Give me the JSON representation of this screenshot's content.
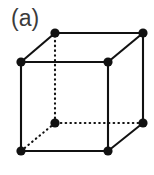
{
  "figure": {
    "panel_label": "(a)",
    "caption_visible": false,
    "background_color": "#ffffff",
    "ink_color": "#111111",
    "label_color": "#3b3b3b",
    "width": 154,
    "height": 175
  },
  "diagram": {
    "name": "simple-cubic-unit-cell",
    "vertex_radius": 4.6,
    "vertex_fill": "#111111",
    "solid_stroke_width": 2.1,
    "dotted_stroke_width": 2.1,
    "dotted_dash_pattern": "0.6 4.2",
    "vertices": [
      {
        "id": "front-top-left",
        "x": 21,
        "y": 62,
        "hidden": false
      },
      {
        "id": "front-top-right",
        "x": 108,
        "y": 62,
        "hidden": false
      },
      {
        "id": "front-bottom-right",
        "x": 108,
        "y": 151,
        "hidden": false
      },
      {
        "id": "front-bottom-left",
        "x": 21,
        "y": 151,
        "hidden": false
      },
      {
        "id": "back-top-left",
        "x": 55,
        "y": 33,
        "hidden": false
      },
      {
        "id": "back-top-right",
        "x": 143,
        "y": 33,
        "hidden": false
      },
      {
        "id": "back-bottom-right",
        "x": 143,
        "y": 123,
        "hidden": false
      },
      {
        "id": "back-bottom-left",
        "x": 55,
        "y": 123,
        "hidden": true
      }
    ],
    "edges": [
      {
        "id": "front-top",
        "from": "front-top-left",
        "to": "front-top-right",
        "style": "solid"
      },
      {
        "id": "front-right",
        "from": "front-top-right",
        "to": "front-bottom-right",
        "style": "solid"
      },
      {
        "id": "front-bottom",
        "from": "front-bottom-right",
        "to": "front-bottom-left",
        "style": "solid"
      },
      {
        "id": "front-left",
        "from": "front-bottom-left",
        "to": "front-top-left",
        "style": "solid"
      },
      {
        "id": "back-top",
        "from": "back-top-left",
        "to": "back-top-right",
        "style": "solid"
      },
      {
        "id": "back-right",
        "from": "back-top-right",
        "to": "back-bottom-right",
        "style": "solid"
      },
      {
        "id": "back-bottom",
        "from": "back-bottom-right",
        "to": "back-bottom-left",
        "style": "dotted"
      },
      {
        "id": "back-left",
        "from": "back-bottom-left",
        "to": "back-top-left",
        "style": "dotted"
      },
      {
        "id": "diagonal-top-left",
        "from": "front-top-left",
        "to": "back-top-left",
        "style": "solid"
      },
      {
        "id": "diagonal-top-right",
        "from": "front-top-right",
        "to": "back-top-right",
        "style": "solid"
      },
      {
        "id": "diagonal-bottom-right",
        "from": "front-bottom-right",
        "to": "back-bottom-right",
        "style": "solid"
      },
      {
        "id": "diagonal-bottom-left",
        "from": "front-bottom-left",
        "to": "back-bottom-left",
        "style": "dotted"
      }
    ]
  }
}
